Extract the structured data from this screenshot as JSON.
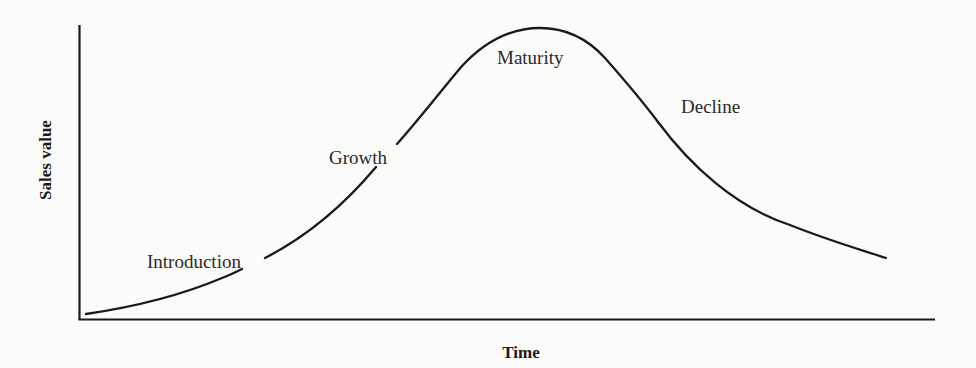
{
  "figure": {
    "type": "product-life-cycle",
    "axes": {
      "y_label": "Sales value",
      "x_label": "Time"
    },
    "stages": [
      {
        "id": "introduction",
        "label": "Introduction"
      },
      {
        "id": "growth",
        "label": "Growth"
      },
      {
        "id": "maturity",
        "label": "Maturity"
      },
      {
        "id": "decline",
        "label": "Decline"
      }
    ],
    "colors": {
      "line": "#1a1a1a",
      "background": "#fbfbfa"
    }
  }
}
